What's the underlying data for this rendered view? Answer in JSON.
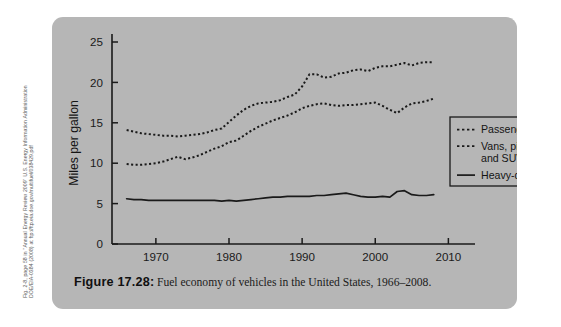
{
  "source_credit": {
    "line1": "Fig. 2-8, page 58 in \"Annual Energy Review 2009\" U.S. Energy Information Administration",
    "line2": "DOE/EIA-0384 (2008) at ftp://ftp.eia.doe.gov/multifuel/038429.pdf"
  },
  "caption": {
    "figure_label": "Figure 17.28",
    "colon": ":",
    "text": "Fuel economy of vehicles in the United States, 1966–2008."
  },
  "chart_data": {
    "type": "line",
    "title": "",
    "xlabel": "",
    "ylabel": "Miles per gallon",
    "xlim": [
      1964,
      2012
    ],
    "ylim": [
      0,
      25
    ],
    "grid": false,
    "legend_position": "right",
    "x_ticks": [
      1970,
      1980,
      1990,
      2000,
      2010
    ],
    "x_tick_labels": [
      "1970",
      "1980",
      "1990",
      "2000",
      "2010"
    ],
    "y_ticks": [
      0,
      5,
      10,
      15,
      20,
      25
    ],
    "y_tick_labels": [
      "0",
      "5",
      "10",
      "15",
      "20",
      "25"
    ],
    "series": [
      {
        "name": "Passenger cars",
        "style": "dashed",
        "color": "#1a1a1a",
        "x": [
          1966,
          1967,
          1968,
          1969,
          1970,
          1971,
          1972,
          1973,
          1974,
          1975,
          1976,
          1977,
          1978,
          1979,
          1980,
          1981,
          1982,
          1983,
          1984,
          1985,
          1986,
          1987,
          1988,
          1989,
          1990,
          1991,
          1992,
          1993,
          1994,
          1995,
          1996,
          1997,
          1998,
          1999,
          2000,
          2001,
          2002,
          2003,
          2004,
          2005,
          2006,
          2007,
          2008
        ],
        "values": [
          14.1,
          13.9,
          13.7,
          13.6,
          13.5,
          13.4,
          13.4,
          13.3,
          13.4,
          13.5,
          13.6,
          13.8,
          14.1,
          14.3,
          15.1,
          15.9,
          16.6,
          17.1,
          17.4,
          17.5,
          17.6,
          17.8,
          18.2,
          18.5,
          19.5,
          21.0,
          21.0,
          20.6,
          20.7,
          21.1,
          21.2,
          21.5,
          21.6,
          21.4,
          21.8,
          22.0,
          22.0,
          22.2,
          22.4,
          22.1,
          22.4,
          22.5,
          22.5
        ]
      },
      {
        "name": "Vans, pickup trucks, and SUVs",
        "style": "dashed",
        "color": "#1a1a1a",
        "x": [
          1966,
          1967,
          1968,
          1969,
          1970,
          1971,
          1972,
          1973,
          1974,
          1975,
          1976,
          1977,
          1978,
          1979,
          1980,
          1981,
          1982,
          1983,
          1984,
          1985,
          1986,
          1987,
          1988,
          1989,
          1990,
          1991,
          1992,
          1993,
          1994,
          1995,
          1996,
          1997,
          1998,
          1999,
          2000,
          2001,
          2002,
          2003,
          2004,
          2005,
          2006,
          2007,
          2008
        ],
        "values": [
          9.9,
          9.8,
          9.8,
          9.9,
          10.0,
          10.2,
          10.5,
          10.8,
          10.5,
          10.7,
          11.0,
          11.4,
          11.8,
          12.1,
          12.6,
          12.8,
          13.4,
          14.0,
          14.5,
          14.9,
          15.3,
          15.6,
          15.9,
          16.3,
          16.8,
          17.1,
          17.3,
          17.4,
          17.2,
          17.1,
          17.2,
          17.2,
          17.3,
          17.4,
          17.5,
          17.1,
          16.6,
          16.2,
          16.9,
          17.4,
          17.5,
          17.7,
          18.0
        ]
      },
      {
        "name": "Heavy-duty trucks",
        "style": "solid",
        "color": "#1a1a1a",
        "x": [
          1966,
          1967,
          1968,
          1969,
          1970,
          1971,
          1972,
          1973,
          1974,
          1975,
          1976,
          1977,
          1978,
          1979,
          1980,
          1981,
          1982,
          1983,
          1984,
          1985,
          1986,
          1987,
          1988,
          1989,
          1990,
          1991,
          1992,
          1993,
          1994,
          1995,
          1996,
          1997,
          1998,
          1999,
          2000,
          2001,
          2002,
          2003,
          2004,
          2005,
          2006,
          2007,
          2008
        ],
        "values": [
          5.6,
          5.5,
          5.5,
          5.4,
          5.4,
          5.4,
          5.4,
          5.4,
          5.4,
          5.4,
          5.4,
          5.4,
          5.4,
          5.3,
          5.4,
          5.3,
          5.4,
          5.5,
          5.6,
          5.7,
          5.8,
          5.8,
          5.9,
          5.9,
          5.9,
          5.9,
          6.0,
          6.0,
          6.1,
          6.2,
          6.3,
          6.1,
          5.9,
          5.8,
          5.8,
          5.9,
          5.8,
          6.5,
          6.6,
          6.1,
          6.0,
          6.0,
          6.1
        ]
      }
    ],
    "legend": [
      {
        "label": "Passenger cars",
        "style": "dashed"
      },
      {
        "label": "Vans, pickup trucks,",
        "label2": "and SUVs",
        "style": "dashed"
      },
      {
        "label": "Heavy-duty trucks",
        "style": "solid"
      }
    ]
  }
}
